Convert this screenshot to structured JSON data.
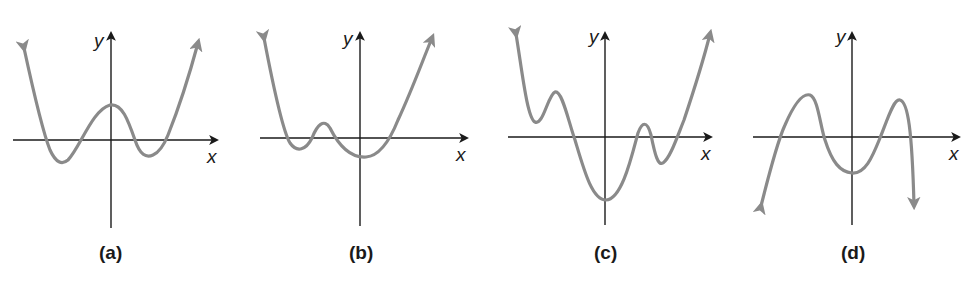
{
  "figure": {
    "panels": [
      {
        "id": "a",
        "caption": "(a)",
        "x_label": "x",
        "y_label": "y",
        "description": "Even-degree polynomial, both ends up; 4 x-intercepts; local max above x-axis near y-axis; two local minima below axis"
      },
      {
        "id": "b",
        "caption": "(b)",
        "x_label": "x",
        "y_label": "y",
        "description": "Even-degree polynomial, both ends up; 4 x-intercepts; small local max left of y-axis; global min just right of y-axis below axis"
      },
      {
        "id": "c",
        "caption": "(c)",
        "x_label": "x",
        "y_label": "y",
        "description": "Even-degree polynomial, both ends up; 4 x-intercepts; local min above axis on far left; deep global min on y-axis; narrow local max right of y-axis"
      },
      {
        "id": "d",
        "caption": "(d)",
        "x_label": "x",
        "y_label": "y",
        "description": "Even-degree polynomial, both ends down; 4 x-intercepts; two local maxima above axis; local min below axis on y-axis"
      }
    ]
  },
  "colors": {
    "axis": "#1a1a1a",
    "curve": "#8a8a8a",
    "background": "#ffffff"
  }
}
